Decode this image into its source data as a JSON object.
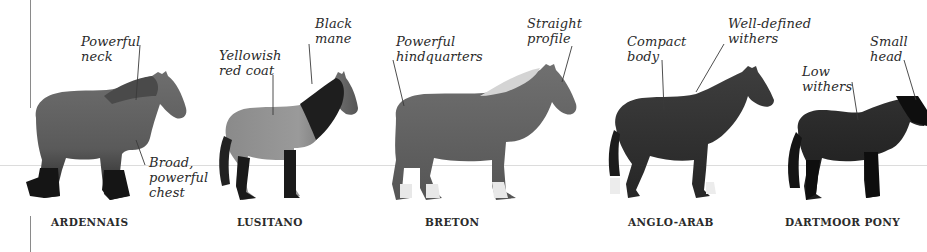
{
  "page": {
    "type": "illustrated book page — horse breeds with annotations"
  },
  "breeds": [
    {
      "name": "ARDENNAIS",
      "annotations": [
        {
          "text_line1": "Powerful",
          "text_line2": "neck"
        },
        {
          "text_line1": "Broad,",
          "text_line2": "powerful",
          "text_line3": "chest"
        }
      ]
    },
    {
      "name": "LUSITANO",
      "annotations": [
        {
          "text_line1": "Yellowish",
          "text_line2": "red coat"
        },
        {
          "text_line1": "Black",
          "text_line2": "mane"
        }
      ]
    },
    {
      "name": "BRETON",
      "annotations": [
        {
          "text_line1": "Powerful",
          "text_line2": "hindquarters"
        },
        {
          "text_line1": "Straight",
          "text_line2": "profile"
        }
      ]
    },
    {
      "name": "ANGLO-ARAB",
      "annotations": [
        {
          "text_line1": "Compact",
          "text_line2": "body"
        },
        {
          "text_line1": "Well-defined",
          "text_line2": "withers"
        }
      ]
    },
    {
      "name": "DARTMOOR PONY",
      "annotations": [
        {
          "text_line1": "Low",
          "text_line2": "withers"
        },
        {
          "text_line1": "Small",
          "text_line2": "head"
        }
      ]
    }
  ],
  "colors": {
    "background": "#ffffff",
    "text": "#2a2a2a",
    "rule": "#8a8a8a",
    "horizon": "#dcdcdc"
  }
}
